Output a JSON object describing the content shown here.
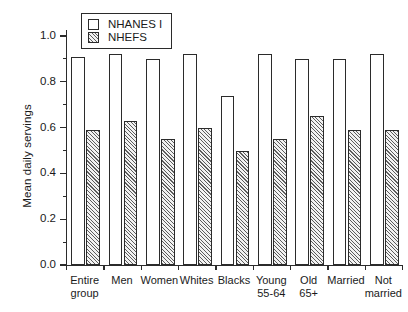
{
  "chart_data": {
    "type": "bar",
    "title": "",
    "xlabel": "",
    "ylabel": "Mean daily servings",
    "ylim": [
      0.0,
      1.0
    ],
    "ytick_labels": [
      "0.0",
      "0.2",
      "0.4",
      "0.6",
      "0.8",
      "1.0"
    ],
    "ytick_values": [
      0.0,
      0.2,
      0.4,
      0.6,
      0.8,
      1.0
    ],
    "minor_ticks": true,
    "grid": false,
    "legend_position": "top-left",
    "categories": [
      "Entire\ngroup",
      "Men",
      "Women",
      "Whites",
      "Blacks",
      "Young\n55-64",
      "Old\n65+",
      "Married",
      "Not\nmarried"
    ],
    "series": [
      {
        "name": "NHANES I",
        "style": "open",
        "values": [
          0.91,
          0.92,
          0.9,
          0.92,
          0.74,
          0.92,
          0.9,
          0.9,
          0.92
        ]
      },
      {
        "name": "NHEFS",
        "style": "hatched",
        "values": [
          0.59,
          0.63,
          0.55,
          0.6,
          0.5,
          0.55,
          0.65,
          0.59,
          0.59
        ]
      }
    ]
  },
  "legend": {
    "entries": [
      {
        "label": "NHANES I",
        "style": "open"
      },
      {
        "label": "NHEFS",
        "style": "hatched"
      }
    ]
  },
  "colors": {
    "axis": "#2b2b2b",
    "bar_open_fill": "#ffffff",
    "bar_hatch_line": "#5d5d5d",
    "background": "#ffffff"
  }
}
